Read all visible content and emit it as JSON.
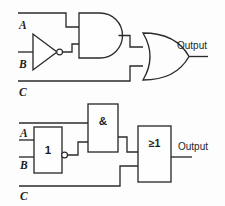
{
  "figure": {
    "line_color": "#2b2b2b",
    "background_color": "#fdfdfd",
    "fill_color": "#fefefe"
  },
  "top_circuit": {
    "notation": "ANSI/IEEE distinctive-shape symbols",
    "inputs": [
      {
        "label": "A",
        "row": "top"
      },
      {
        "label": "B",
        "row": "middle"
      },
      {
        "label": "C",
        "row": "bottom"
      }
    ],
    "gates": [
      {
        "name": "inverter",
        "symbol_shape": "triangle-with-bubble",
        "inputs": [
          "B"
        ]
      },
      {
        "name": "and-gate",
        "symbol_shape": "d-shape",
        "inputs": [
          "A",
          "not-B"
        ]
      },
      {
        "name": "or-gate",
        "symbol_shape": "curved-shield",
        "inputs": [
          "and-out",
          "C"
        ]
      }
    ],
    "output": {
      "label": "Output"
    }
  },
  "bottom_circuit": {
    "notation": "IEC rectangular symbols",
    "inputs": [
      {
        "label": "A",
        "row": "upper"
      },
      {
        "label": "B",
        "row": "lower"
      },
      {
        "label": "C",
        "row": "bottom"
      }
    ],
    "boxes": [
      {
        "name": "inverter-box",
        "symbol_text": "1",
        "has_output_bubble": true
      },
      {
        "name": "and-box",
        "symbol_text": "&",
        "has_output_bubble": false
      },
      {
        "name": "or-box",
        "symbol_text": "≥1",
        "has_output_bubble": false
      }
    ],
    "output": {
      "label": "Output"
    }
  }
}
